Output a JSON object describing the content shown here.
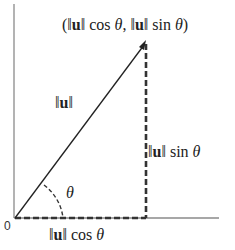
{
  "diagram": {
    "origin_label": "0",
    "point_label": {
      "open": "(",
      "norm1": "‖",
      "vec": "u",
      "norm2": "‖",
      "cos_part": " cos ",
      "theta1": "θ",
      "sep": ", ",
      "norm3": "‖",
      "vec2": "u",
      "norm4": "‖",
      "sin_part": " sin ",
      "theta2": "θ",
      "close": ")"
    },
    "hypotenuse_label": {
      "norm1": "‖",
      "vec": "u",
      "norm2": "‖"
    },
    "vertical_label": {
      "norm1": "‖",
      "vec": "u",
      "norm2": "‖",
      "fn": " sin ",
      "theta": "θ"
    },
    "horizontal_label": {
      "norm1": "‖",
      "vec": "u",
      "norm2": "‖",
      "fn": " cos ",
      "theta": "θ"
    },
    "angle_label": "θ",
    "colors": {
      "axis": "#888888",
      "vector": "#222222",
      "dashed": "#333333"
    }
  }
}
